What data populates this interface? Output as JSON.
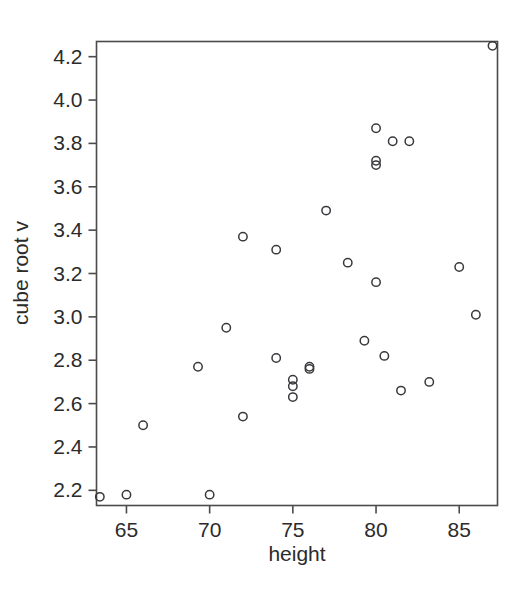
{
  "figure": {
    "background_color": "#ffffff",
    "point_color": "#39393d",
    "axis_color": "#4a4a4a",
    "text_color": "#2b2b2b"
  },
  "chart_data": {
    "type": "scatter",
    "title": "",
    "subtitle": "",
    "xlabel": "height",
    "ylabel": "cube root v",
    "xlim": [
      63.2,
      87.3
    ],
    "ylim": [
      2.13,
      4.27
    ],
    "xticks": [
      65,
      70,
      75,
      80,
      85
    ],
    "xtick_labels": [
      "65",
      "70",
      "75",
      "80",
      "85"
    ],
    "yticks": [
      2.2,
      2.4,
      2.6,
      2.8,
      3.0,
      3.2,
      3.4,
      3.6,
      3.8,
      4.0,
      4.2
    ],
    "ytick_labels": [
      "2.2",
      "2.4",
      "2.6",
      "2.8",
      "3.0",
      "3.2",
      "3.4",
      "3.6",
      "3.8",
      "4.0",
      "4.2"
    ],
    "grid": false,
    "legend": false,
    "legend_position": "none",
    "marker": "open-circle",
    "n_points": 31,
    "x": [
      63.4,
      65.0,
      66.0,
      69.3,
      70.0,
      71.0,
      72.0,
      72.0,
      74.0,
      74.0,
      75.0,
      75.0,
      75.0,
      76.0,
      76.0,
      77.0,
      78.3,
      79.3,
      80.0,
      80.0,
      80.0,
      80.0,
      80.5,
      81.0,
      81.5,
      82.0,
      83.2,
      85.0,
      86.0,
      87.0,
      87.0
    ],
    "y": [
      2.17,
      2.18,
      2.5,
      2.77,
      2.18,
      2.95,
      3.37,
      2.54,
      3.31,
      2.81,
      2.71,
      2.68,
      2.63,
      2.77,
      2.76,
      3.49,
      3.25,
      2.89,
      3.87,
      3.72,
      3.7,
      3.16,
      2.82,
      3.81,
      2.66,
      3.81,
      2.7,
      3.23,
      3.01,
      4.25,
      4.25
    ],
    "points": [
      {
        "x": 63.4,
        "y": 2.17
      },
      {
        "x": 65.0,
        "y": 2.18
      },
      {
        "x": 66.0,
        "y": 2.5
      },
      {
        "x": 69.3,
        "y": 2.77
      },
      {
        "x": 70.0,
        "y": 2.18
      },
      {
        "x": 71.0,
        "y": 2.95
      },
      {
        "x": 72.0,
        "y": 3.37
      },
      {
        "x": 72.0,
        "y": 2.54
      },
      {
        "x": 74.0,
        "y": 3.31
      },
      {
        "x": 74.0,
        "y": 2.81
      },
      {
        "x": 75.0,
        "y": 2.71
      },
      {
        "x": 75.0,
        "y": 2.68
      },
      {
        "x": 75.0,
        "y": 2.63
      },
      {
        "x": 76.0,
        "y": 2.77
      },
      {
        "x": 76.0,
        "y": 2.76
      },
      {
        "x": 77.0,
        "y": 3.49
      },
      {
        "x": 78.3,
        "y": 3.25
      },
      {
        "x": 79.3,
        "y": 2.89
      },
      {
        "x": 80.0,
        "y": 3.87
      },
      {
        "x": 80.0,
        "y": 3.72
      },
      {
        "x": 80.0,
        "y": 3.7
      },
      {
        "x": 80.0,
        "y": 3.16
      },
      {
        "x": 80.5,
        "y": 2.82
      },
      {
        "x": 81.0,
        "y": 3.81
      },
      {
        "x": 81.5,
        "y": 2.66
      },
      {
        "x": 82.0,
        "y": 3.81
      },
      {
        "x": 83.2,
        "y": 2.7
      },
      {
        "x": 85.0,
        "y": 3.23
      },
      {
        "x": 86.0,
        "y": 3.01
      },
      {
        "x": 87.0,
        "y": 4.25
      }
    ]
  }
}
